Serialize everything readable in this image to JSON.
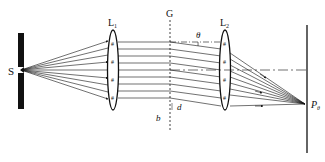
{
  "diagram": {
    "labels": {
      "source": "S",
      "lens1": "L",
      "lens1_sub": "1",
      "grating": "G",
      "lens2": "L",
      "lens2_sub": "2",
      "angle": "θ",
      "slit_width": "b",
      "grating_period": "d",
      "point": "P",
      "point_sub": "θ"
    },
    "components": [
      {
        "id": "slit-screen",
        "label": "S"
      },
      {
        "id": "collimating-lens",
        "label": "L1"
      },
      {
        "id": "grating",
        "label": "G"
      },
      {
        "id": "focusing-lens",
        "label": "L2"
      },
      {
        "id": "observation-screen",
        "label": "Pθ"
      }
    ],
    "colors": {
      "ink": "#111111",
      "background": "#ffffff"
    }
  }
}
